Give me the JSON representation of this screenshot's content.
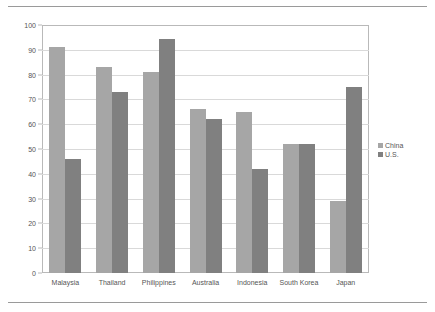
{
  "chart_data": {
    "type": "bar",
    "title": "",
    "xlabel": "",
    "ylabel": "",
    "ylim": [
      0,
      100
    ],
    "ytick_step": 10,
    "yticks": [
      0,
      10,
      20,
      30,
      40,
      50,
      60,
      70,
      80,
      90,
      100
    ],
    "grid": true,
    "legend_position": "right",
    "categories": [
      "Malaysia",
      "Thailand",
      "Philippines",
      "Australia",
      "Indonesia",
      "South Korea",
      "Japan"
    ],
    "series": [
      {
        "name": "China",
        "color": "#a6a6a6",
        "values": [
          91,
          83,
          81,
          66,
          65,
          52,
          29
        ]
      },
      {
        "name": "U.S.",
        "color": "#808080",
        "values": [
          46,
          73,
          94.5,
          62,
          42,
          52,
          75
        ]
      }
    ]
  },
  "legend": {
    "items": [
      {
        "label": "China"
      },
      {
        "label": "U.S."
      }
    ]
  }
}
